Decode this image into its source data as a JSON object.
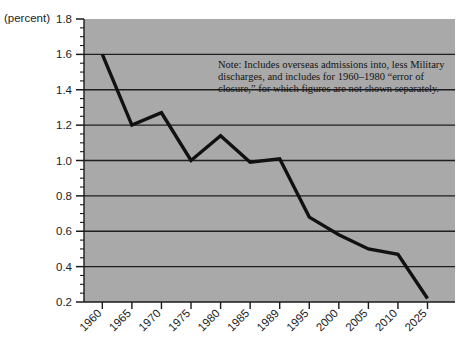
{
  "figure": {
    "unit_label": "(percent)",
    "plot_bg_color": "#a9a9a9",
    "series_color": "#111111",
    "gridline_color": "#1f1f1f",
    "axis_color": "#1a1a1a",
    "note": {
      "line1": "Note: Includes overseas admissions into, less Military",
      "line2": "discharges, and includes for 1960–1980 “error of",
      "line3": "closure,” for which figures are not shown separately."
    },
    "cut_title": ""
  },
  "chart_data": {
    "type": "line",
    "title": "",
    "xlabel": "",
    "ylabel": "(percent)",
    "ylim": [
      0.2,
      1.8
    ],
    "ytick_labels": [
      "1.8",
      "1.6",
      "1.4",
      "1.2",
      "1.0",
      "0.8",
      "0.6",
      "0.4",
      "0.2"
    ],
    "yticks": [
      1.8,
      1.6,
      1.4,
      1.2,
      1.0,
      0.8,
      0.6,
      0.4,
      0.2
    ],
    "y_minor_tick_step": 0.05,
    "gridlines": [
      1.6,
      1.4,
      1.2,
      1.0,
      0.8,
      0.6,
      0.4
    ],
    "grid": true,
    "legend": "none",
    "categories": [
      "1960",
      "1965",
      "1970",
      "1975",
      "1980",
      "1985",
      "1989",
      "1995",
      "2000",
      "2005",
      "2010",
      "2025"
    ],
    "values": [
      1.6,
      1.2,
      1.27,
      1.0,
      1.14,
      0.99,
      1.01,
      0.68,
      0.58,
      0.5,
      0.47,
      0.22
    ],
    "series": [
      {
        "name": "rate",
        "values": [
          1.6,
          1.2,
          1.27,
          1.0,
          1.14,
          0.99,
          1.01,
          0.68,
          0.58,
          0.5,
          0.47,
          0.22
        ]
      }
    ],
    "annotations": [
      "Note: Includes overseas admissions into, less Military discharges, and includes for 1960–1980 “error of closure,” for which figures are not shown separately."
    ]
  }
}
